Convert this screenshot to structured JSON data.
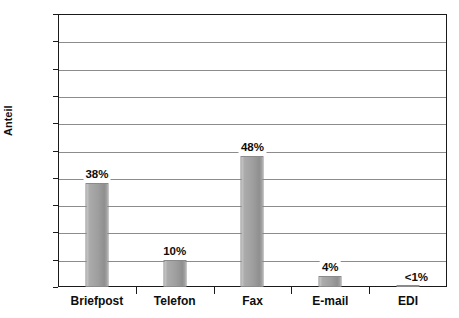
{
  "chart_data": {
    "type": "bar",
    "title": "",
    "subtitle": "",
    "xlabel": "",
    "ylabel": "Anteil",
    "unit_label": "[%]",
    "categories": [
      "Briefpost",
      "Telefon",
      "Fax",
      "E-mail",
      "EDI"
    ],
    "values": [
      38,
      10,
      48,
      4,
      0.5
    ],
    "data_labels": [
      "38%",
      "10%",
      "48%",
      "4%",
      "<1%"
    ],
    "ylim": [
      0,
      100
    ],
    "y_ticks": [
      0,
      10,
      20,
      30,
      40,
      50,
      60,
      70,
      80,
      90,
      100
    ],
    "y_tick_labels": [
      "0",
      "10",
      "20",
      "30",
      "40",
      "50",
      "60",
      "70",
      "80",
      "[%]",
      "100"
    ],
    "grid": true,
    "legend": false,
    "legend_position": "none",
    "series": [
      {
        "name": "Anteil",
        "values": [
          38,
          10,
          48,
          4,
          0.5
        ]
      }
    ]
  },
  "colors": {
    "bar_fill": "#9e9e9e",
    "bar_fill_light": "#c9c9c9",
    "bar_fill_dark": "#8f8f8f",
    "gridline": "#8c8c8c",
    "axis": "#1a1a1a",
    "text": "#0d0d0d",
    "background": "#ffffff"
  },
  "axis": {
    "y_title": "Anteil"
  }
}
